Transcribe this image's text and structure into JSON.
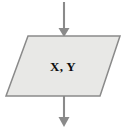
{
  "canvas": {
    "width": 126,
    "height": 129,
    "background_color": "#ffffff"
  },
  "diagram": {
    "type": "flowchart-fragment",
    "title": "",
    "node": {
      "shape": "parallelogram",
      "semantic_role": "input-output",
      "label": "X, Y",
      "fill_color": "#e8e8e6",
      "border_color": "#8a8a8a",
      "border_width": 1.5,
      "points": "28,36 120,36 100,96 6,96",
      "label_x": 63,
      "label_y": 71
    },
    "connectors": [
      {
        "name": "inbound-arrow",
        "direction": "down",
        "color": "#8a8a8a",
        "line_x": 64,
        "line_y1": 2,
        "line_y2": 30,
        "head_points": "58.5,28 69.5,28 64,37"
      },
      {
        "name": "outbound-arrow",
        "direction": "down",
        "color": "#8a8a8a",
        "line_x": 64,
        "line_y1": 96,
        "line_y2": 119,
        "head_points": "58.5,117 69.5,117 64,127"
      }
    ]
  }
}
